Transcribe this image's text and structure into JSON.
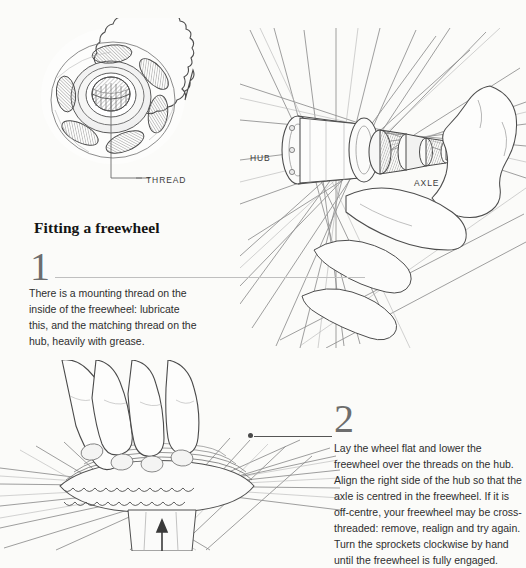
{
  "page": {
    "background_color": "#fbfbf9",
    "ink_color": "#2e2e2e"
  },
  "heading": {
    "text": "Fitting a freewheel"
  },
  "callouts": [
    {
      "name": "thread",
      "text": "THREAD"
    },
    {
      "name": "hub",
      "text": "HUB"
    },
    {
      "name": "axle",
      "text": "AXLE"
    }
  ],
  "steps": [
    {
      "number": "1",
      "body": "There is a mounting thread on the inside of the freewheel: lubricate this, and the matching thread on the hub, heavily with grease."
    },
    {
      "number": "2",
      "body": "Lay the wheel flat and lower the freewheel over the threads on the hub. Align the right side of the hub so that the axle is centred in the freewheel. If it is off-centre, your freewheel may be cross-threaded: remove, realign and try again. Turn the sprockets clockwise by hand until the freewheel is fully engaged."
    }
  ],
  "illustrations": [
    {
      "name": "freewheel-sprocket-illustration",
      "caption": "THREAD"
    },
    {
      "name": "wheel-hub-axle-illustration",
      "caption": "HUB / AXLE"
    },
    {
      "name": "hand-pressing-freewheel-illustration",
      "caption": ""
    }
  ]
}
